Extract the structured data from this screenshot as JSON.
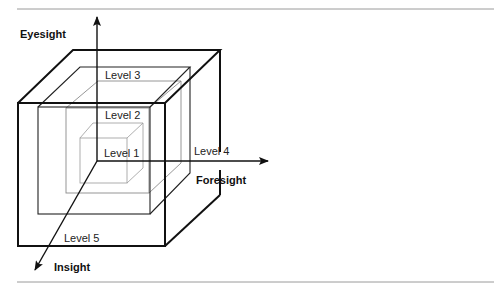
{
  "diagram": {
    "type": "nested-cubes-3d",
    "axes": {
      "vertical": "Eyesight",
      "horizontal": "Foresight",
      "depth": "Insight"
    },
    "levels": [
      {
        "id": 1,
        "label": "Level 1"
      },
      {
        "id": 2,
        "label": "Level 2"
      },
      {
        "id": 3,
        "label": "Level 3"
      },
      {
        "id": 4,
        "label": "Level 4"
      },
      {
        "id": 5,
        "label": "Level 5"
      }
    ],
    "colors": {
      "line": "#111111",
      "inner_line": "#8a8a8a",
      "rule": "#9a9a9a",
      "background": "#ffffff"
    }
  }
}
